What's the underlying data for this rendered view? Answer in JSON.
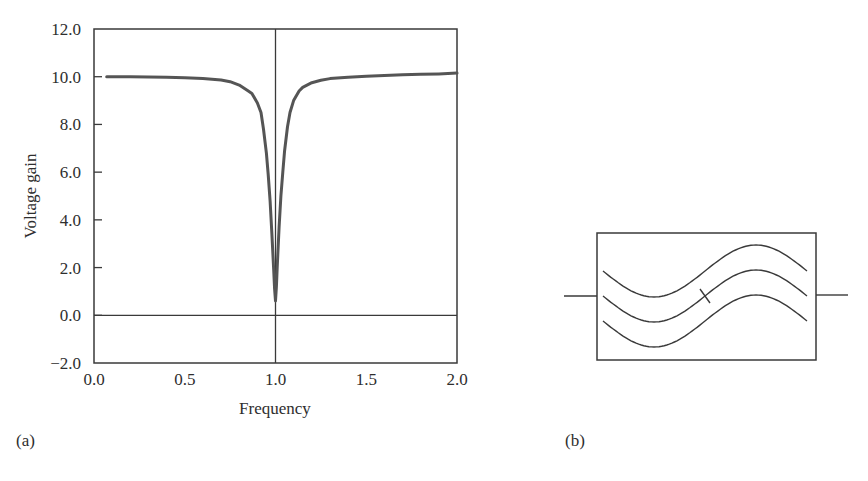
{
  "chart_data": {
    "type": "line",
    "title": "",
    "xlabel": "Frequency",
    "ylabel": "Voltage gain",
    "xlim": [
      0.0,
      2.0
    ],
    "ylim": [
      -2.0,
      12.0
    ],
    "xticks": [
      "0.0",
      "0.5",
      "1.0",
      "1.5",
      "2.0"
    ],
    "xtick_values": [
      0.0,
      0.5,
      1.0,
      1.5,
      2.0
    ],
    "yticks": [
      "12.0",
      "10.0",
      "8.0",
      "6.0",
      "4.0",
      "2.0",
      "0.0",
      "−2.0"
    ],
    "ytick_values": [
      12,
      10,
      8,
      6,
      4,
      2,
      0,
      -2
    ],
    "grid": false,
    "reference_lines": {
      "vertical_x": 1.0,
      "horizontal_y": 0.0
    },
    "series": [
      {
        "name": "voltage gain",
        "color": "#555555",
        "x": [
          0.07,
          0.2,
          0.3,
          0.4,
          0.5,
          0.6,
          0.7,
          0.75,
          0.8,
          0.85,
          0.87,
          0.9,
          0.92,
          0.934,
          0.95,
          0.96,
          0.97,
          0.98,
          0.99,
          0.995,
          1.0,
          1.005,
          1.01,
          1.02,
          1.03,
          1.04,
          1.05,
          1.066,
          1.08,
          1.1,
          1.13,
          1.15,
          1.2,
          1.25,
          1.3,
          1.4,
          1.5,
          1.6,
          1.7,
          1.8,
          1.9,
          2.0
        ],
        "y": [
          10.0,
          10.0,
          9.99,
          9.98,
          9.96,
          9.93,
          9.86,
          9.79,
          9.65,
          9.4,
          9.3,
          8.9,
          8.5,
          7.8,
          6.8,
          5.9,
          4.8,
          3.4,
          1.9,
          1.1,
          0.6,
          1.2,
          2.1,
          3.7,
          5.0,
          6.0,
          6.9,
          7.9,
          8.5,
          9.0,
          9.4,
          9.55,
          9.75,
          9.85,
          9.92,
          9.98,
          10.02,
          10.05,
          10.08,
          10.1,
          10.12,
          10.15
        ]
      }
    ],
    "panel_label": "(a)"
  },
  "diagram": {
    "panel_label": "(b)",
    "wave_count": 3,
    "slash_on_middle_wave": true
  }
}
